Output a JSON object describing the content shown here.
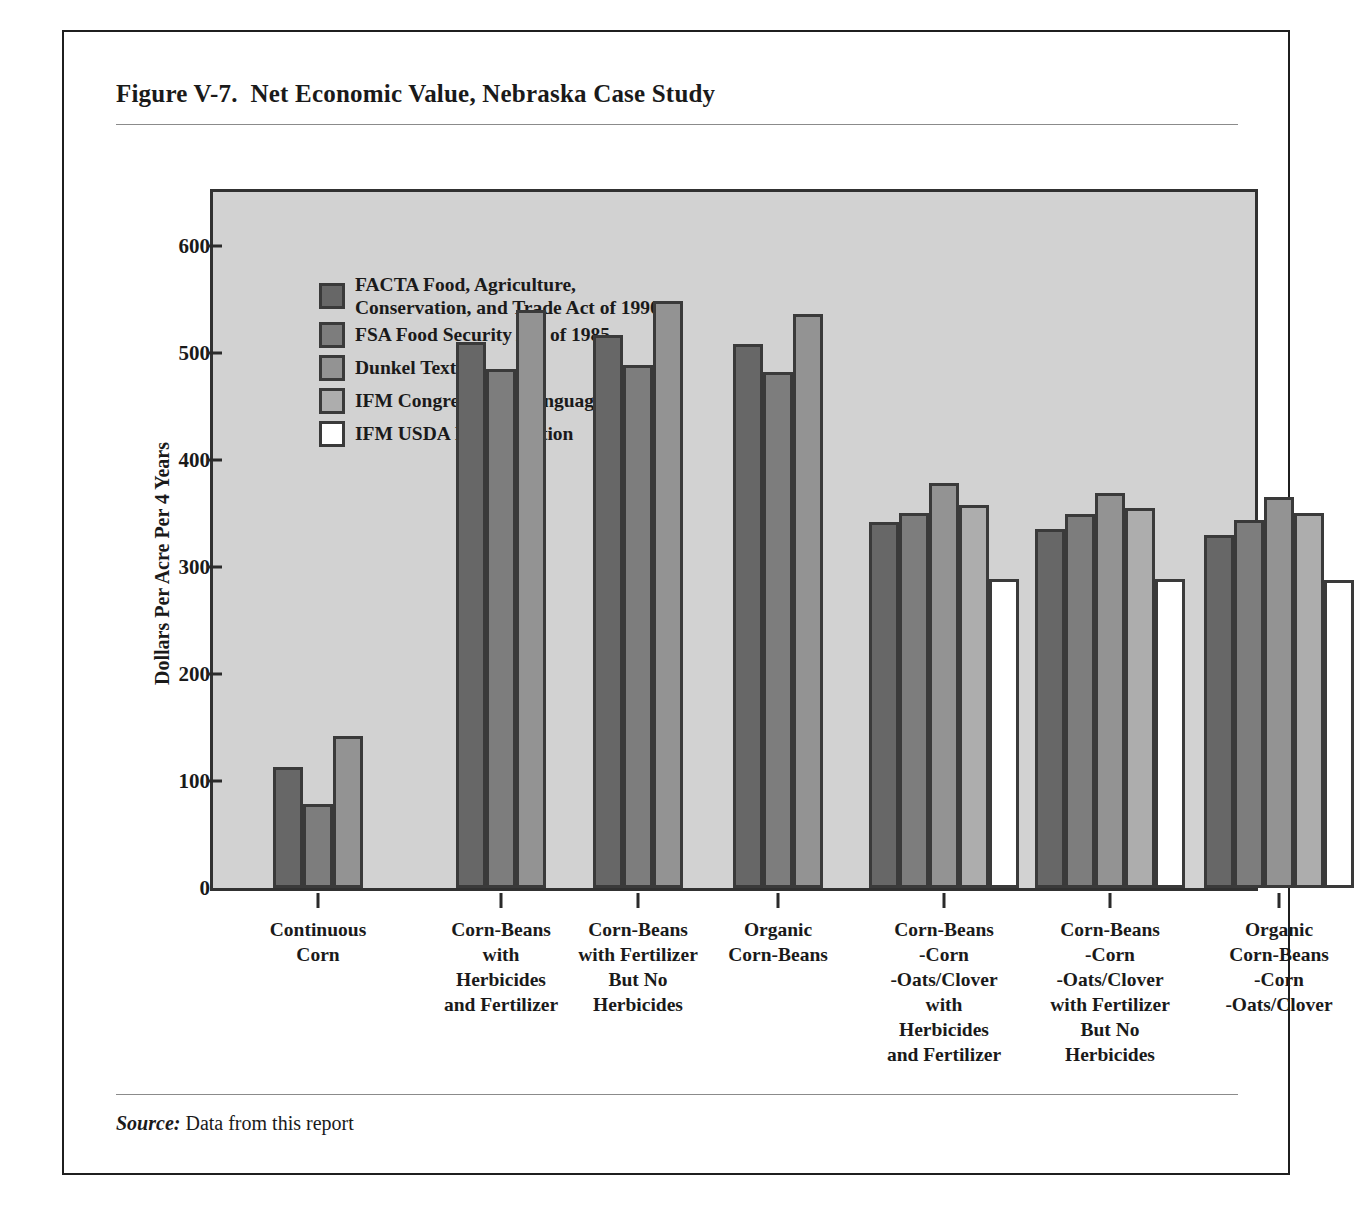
{
  "figure": {
    "title": "Figure V-7.  Net Economic Value, Nebraska Case Study",
    "source_label": "Source:",
    "source_text": " Data from this report"
  },
  "chart_data": {
    "type": "bar",
    "title": "Net Economic Value, Nebraska Case Study",
    "xlabel": "",
    "ylabel": "Dollars Per Acre Per 4 Years",
    "ylim": [
      0,
      650
    ],
    "yticks": [
      0,
      100,
      200,
      300,
      400,
      500,
      600
    ],
    "ytick_labels": [
      "0",
      "100",
      "200",
      "300",
      "400",
      "500",
      "600"
    ],
    "grid": false,
    "legend_position": "upper-left-inside",
    "plot_background": "#d2d2d2",
    "categories": [
      "Continuous\nCorn",
      "Corn-Beans\nwith\nHerbicides\nand Fertilizer",
      "Corn-Beans\nwith Fertilizer\nBut No\nHerbicides",
      "Organic\nCorn-Beans",
      "Corn-Beans\n-Corn\n-Oats/Clover\nwith\nHerbicides\nand Fertilizer",
      "Corn-Beans\n-Corn\n-Oats/Clover\nwith Fertilizer\nBut No\nHerbicides",
      "Organic\nCorn-Beans\n-Corn\n-Oats/Clover"
    ],
    "series": [
      {
        "name": "FACTA  Food, Agriculture,\nConservation, and Trade Act of 1990",
        "short_name": "FACTA",
        "color": "#676767",
        "values": [
          113,
          510,
          516,
          508,
          342,
          335,
          330
        ]
      },
      {
        "name": "FSA  Food Security Act of 1985",
        "short_name": "FSA",
        "color": "#7d7d7d",
        "values": [
          78,
          485,
          488,
          482,
          350,
          349,
          344
        ]
      },
      {
        "name": "Dunkel Text",
        "short_name": "Dunkel",
        "color": "#939393",
        "values": [
          142,
          540,
          548,
          536,
          378,
          369,
          365
        ]
      },
      {
        "name": "IFM  Congressional Language",
        "short_name": "IFM Congressional",
        "color": "#adadad",
        "values": [
          null,
          null,
          null,
          null,
          358,
          355,
          350
        ]
      },
      {
        "name": "IFM  USDA Interpretation",
        "short_name": "IFM USDA",
        "color": "#ffffff",
        "values": [
          null,
          null,
          null,
          null,
          289,
          289,
          288
        ]
      }
    ]
  }
}
